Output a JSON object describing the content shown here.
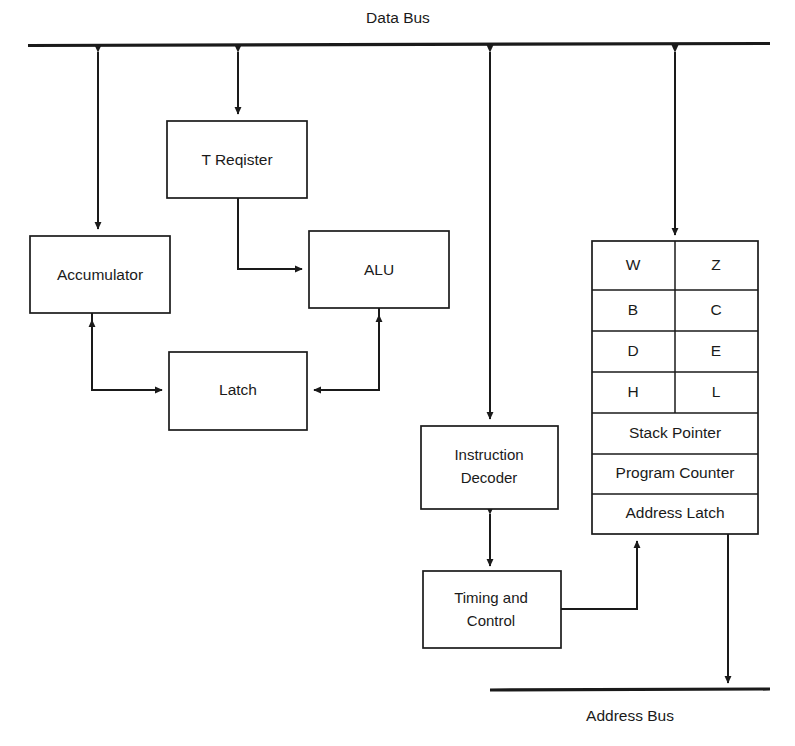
{
  "diagram": {
    "width": 795,
    "height": 746,
    "background_color": "#ffffff",
    "line_color": "#1a1a1a"
  },
  "buses": {
    "data_bus": {
      "label": "Data Bus",
      "x1": 28,
      "x2": 770,
      "y": 45,
      "label_x": 398,
      "label_y": 18
    },
    "address_bus": {
      "label": "Address Bus",
      "x1": 490,
      "x2": 770,
      "y": 690,
      "label_x": 630,
      "label_y": 716
    }
  },
  "blocks": {
    "t_register": {
      "label": "T Reqister",
      "x": 167,
      "y": 121,
      "w": 140,
      "h": 77
    },
    "accumulator": {
      "label": "Accumulator",
      "x": 30,
      "y": 236,
      "w": 140,
      "h": 77
    },
    "alu": {
      "label": "ALU",
      "x": 309,
      "y": 231,
      "w": 140,
      "h": 77
    },
    "latch": {
      "label": "Latch",
      "x": 169,
      "y": 352,
      "w": 138,
      "h": 78
    },
    "instruction_decoder": {
      "label_line1": "Instruction",
      "label_line2": "Decoder",
      "x": 421,
      "y": 426,
      "w": 137,
      "h": 83
    },
    "timing_control": {
      "label_line1": "Timing and",
      "label_line2": "Control",
      "x": 423,
      "y": 571,
      "w": 138,
      "h": 77
    }
  },
  "register_file": {
    "x": 592,
    "y": 241,
    "w": 166,
    "h": 293,
    "split_x": 675,
    "paired_rows": [
      {
        "left": "W",
        "right": "Z"
      },
      {
        "left": "B",
        "right": "C"
      },
      {
        "left": "D",
        "right": "E"
      },
      {
        "left": "H",
        "right": "L"
      }
    ],
    "full_rows": [
      "Stack Pointer",
      "Program Counter",
      "Address Latch"
    ],
    "row_boundaries": [
      241,
      290,
      331,
      372,
      413,
      454,
      494,
      534
    ]
  },
  "connections": [
    {
      "name": "accumulator-to-data-bus",
      "type": "bidirectional-vertical"
    },
    {
      "name": "t-register-to-data-bus",
      "type": "bidirectional-vertical"
    },
    {
      "name": "instruction-decoder-to-data-bus",
      "type": "bidirectional-vertical"
    },
    {
      "name": "register-file-to-data-bus",
      "type": "bidirectional-vertical"
    },
    {
      "name": "t-register-to-alu",
      "type": "elbow-arrow"
    },
    {
      "name": "accumulator-to-latch",
      "type": "elbow-arrow"
    },
    {
      "name": "alu-to-latch",
      "type": "elbow-arrow"
    },
    {
      "name": "latch-to-accumulator",
      "type": "elbow-arrow"
    },
    {
      "name": "latch-to-alu",
      "type": "elbow-arrow"
    },
    {
      "name": "instruction-decoder-to-timing-control",
      "type": "bidirectional-vertical"
    },
    {
      "name": "timing-control-to-register-file",
      "type": "elbow-arrow"
    },
    {
      "name": "register-file-to-address-bus",
      "type": "arrow-down"
    }
  ]
}
